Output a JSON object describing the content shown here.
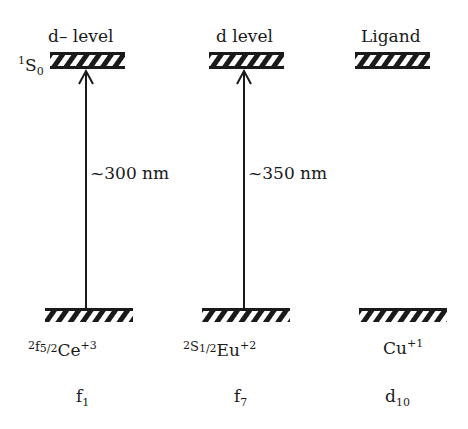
{
  "diagram": {
    "type": "energy-level-diagram",
    "columns": [
      {
        "upper_level_label": "d– level",
        "upper_state_term": {
          "sup": "1",
          "main": "S",
          "sub": "0"
        },
        "transition_label": "~300 nm",
        "ground_state": {
          "term_sup": "2",
          "term_main": "f",
          "term_sub": "5/2",
          "ion": "Ce",
          "charge": "+3"
        },
        "configuration": {
          "main": "f",
          "sub": "1"
        }
      },
      {
        "upper_level_label": "d level",
        "transition_label": "~350 nm",
        "ground_state": {
          "term_sup": "2",
          "term_main": "S",
          "term_sub": "1/2",
          "ion": "Eu",
          "charge": "+2"
        },
        "configuration": {
          "main": "f",
          "sub": "7"
        }
      },
      {
        "upper_level_label": "Ligand",
        "ground_state": {
          "ion": "Cu",
          "charge": "+1"
        },
        "configuration": {
          "main": "d",
          "sub": "10"
        }
      }
    ],
    "colors": {
      "ink": "#1a1a1a",
      "background": "#ffffff"
    }
  }
}
